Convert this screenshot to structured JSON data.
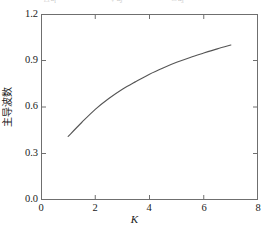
{
  "figure": {
    "background_color": "#ffffff",
    "frame_color": "#6f6f6f",
    "curve_color": "#555555"
  },
  "legend_strip": {
    "visible_fragment": true,
    "entries": [
      {
        "symbol": "△",
        "label": "a",
        "sub": "1"
      },
      {
        "symbol": "▽",
        "label": "a",
        "sub": "2"
      },
      {
        "symbol": "□",
        "label": "a",
        "sub": "3"
      }
    ]
  },
  "axes": {
    "x_title": "K",
    "y_title": "主导波数",
    "x_ticks": [
      "0",
      "2",
      "4",
      "6",
      "8"
    ],
    "y_ticks": [
      "1.2",
      "0.9",
      "0.6",
      "0.3",
      "0.0"
    ]
  },
  "chart_data": {
    "type": "line",
    "title": "",
    "subtitle": "",
    "xlabel": "K",
    "ylabel": "主导波数",
    "xlim": [
      0,
      8
    ],
    "ylim": [
      0.0,
      1.2
    ],
    "xticks": [
      0,
      2,
      4,
      6,
      8
    ],
    "yticks": [
      0.0,
      0.3,
      0.6,
      0.9,
      1.2
    ],
    "grid": false,
    "legend": "none",
    "series": [
      {
        "name": "主导波数",
        "color": "#555555",
        "x": [
          1.0,
          1.5,
          2.0,
          2.5,
          3.0,
          3.5,
          4.0,
          4.5,
          5.0,
          5.5,
          6.0,
          6.5,
          7.0
        ],
        "y": [
          0.41,
          0.5,
          0.585,
          0.655,
          0.715,
          0.765,
          0.812,
          0.852,
          0.888,
          0.92,
          0.948,
          0.975,
          1.0
        ]
      }
    ]
  }
}
